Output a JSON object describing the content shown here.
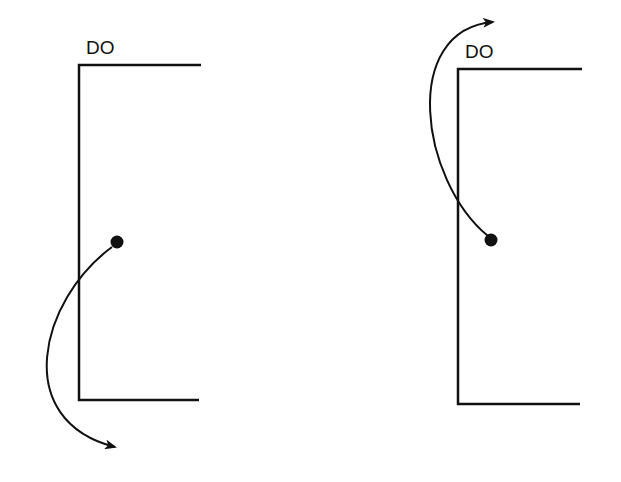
{
  "panels": [
    {
      "label": "DO",
      "direction": "down"
    },
    {
      "label": "DO",
      "direction": "up"
    }
  ]
}
